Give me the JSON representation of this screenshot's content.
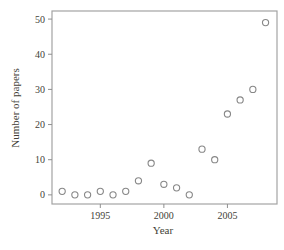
{
  "chart_data": {
    "type": "scatter",
    "title": "",
    "xlabel": "Year",
    "ylabel": "Number of papers",
    "x": [
      1992,
      1993,
      1994,
      1995,
      1996,
      1997,
      1998,
      1999,
      2000,
      2001,
      2002,
      2003,
      2004,
      2005,
      2006,
      2007,
      2008
    ],
    "y": [
      1,
      0,
      0,
      1,
      0,
      1,
      4,
      9,
      3,
      2,
      0,
      13,
      10,
      23,
      27,
      30,
      49
    ],
    "xticks": [
      1995,
      2000,
      2005
    ],
    "yticks": [
      0,
      10,
      20,
      30,
      40,
      50
    ],
    "xlim": [
      1991.2,
      2008.9
    ],
    "ylim": [
      -2.6,
      52.3
    ],
    "grid": false,
    "legend": null,
    "marker": "open-circle",
    "colors": {
      "background": "#ffffff",
      "frame": "#a3a3a3",
      "tick": "#8f8f8f",
      "marker_stroke": "#878787",
      "text": "#433f38"
    }
  }
}
